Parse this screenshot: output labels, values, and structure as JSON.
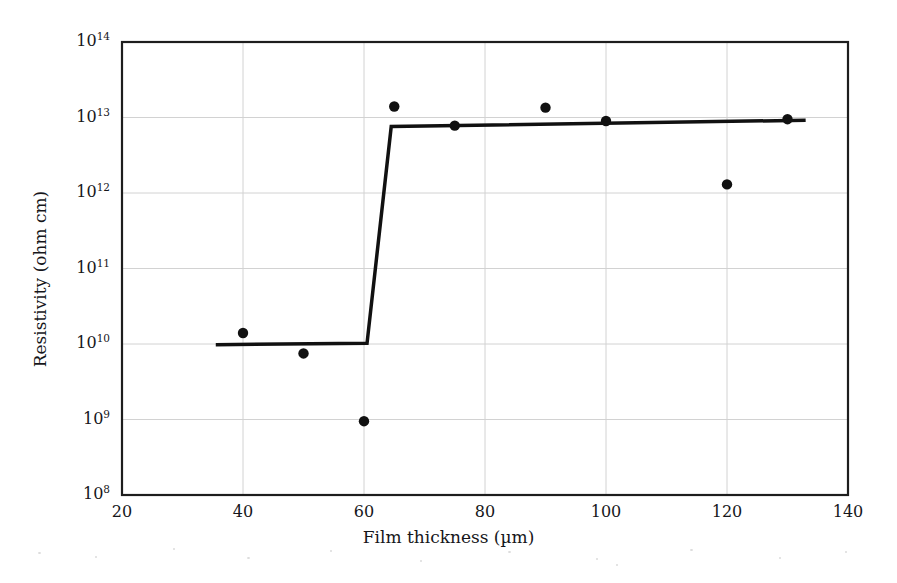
{
  "chart_data": {
    "type": "scatter",
    "title": "",
    "xlabel": "Film thickness (µm)",
    "ylabel": "Resistivity (ohm cm)",
    "xlim": [
      20,
      140
    ],
    "ylim": [
      100000000.0,
      100000000000000.0
    ],
    "yscale": "log",
    "xscale": "linear",
    "grid": true,
    "legend": null,
    "xticks": [
      20,
      40,
      60,
      80,
      100,
      120,
      140
    ],
    "xtick_labels": [
      "20",
      "40",
      "60",
      "80",
      "100",
      "120",
      "140"
    ],
    "yticks": [
      100000000.0,
      1000000000.0,
      10000000000.0,
      100000000000.0,
      1000000000000.0,
      10000000000000.0,
      100000000000000.0
    ],
    "ytick_labels": [
      "10⁸",
      "10⁹",
      "10¹⁰",
      "10¹¹",
      "10¹²",
      "10¹³",
      "10¹⁴"
    ],
    "ytick_mantissas": [
      "10",
      "10",
      "10",
      "10",
      "10",
      "10",
      "10"
    ],
    "ytick_exponents": [
      "8",
      "9",
      "10",
      "11",
      "12",
      "13",
      "14"
    ],
    "series": [
      {
        "name": "measured resistivity",
        "marker": "filled-circle",
        "color": "#111111",
        "points": [
          {
            "x": 40,
            "y": 14000000000.0
          },
          {
            "x": 50,
            "y": 7500000000.0
          },
          {
            "x": 60,
            "y": 950000000.0
          },
          {
            "x": 65,
            "y": 14000000000000.0
          },
          {
            "x": 75,
            "y": 7800000000000.0
          },
          {
            "x": 90,
            "y": 13500000000000.0
          },
          {
            "x": 100,
            "y": 9000000000000.0
          },
          {
            "x": 120,
            "y": 1300000000000.0
          },
          {
            "x": 130,
            "y": 9500000000000.0
          }
        ]
      },
      {
        "name": "step fit line",
        "marker": "none",
        "color": "#111111",
        "linewidth": 3.5,
        "points": [
          {
            "x": 35.5,
            "y": 9800000000.0
          },
          {
            "x": 60.5,
            "y": 10200000000.0
          },
          {
            "x": 64.5,
            "y": 7600000000000.0
          },
          {
            "x": 133,
            "y": 9200000000000.0
          }
        ]
      }
    ]
  },
  "plot_box": {
    "left": 122,
    "top": 42,
    "right": 848,
    "bottom": 495,
    "frame_color": "#1d1d1d",
    "grid_color": "#d2d2d2",
    "background": "#ffffff"
  }
}
